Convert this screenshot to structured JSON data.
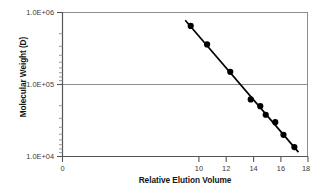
{
  "chart_data": {
    "type": "scatter",
    "title": "",
    "xlabel": "Relative Elution Volume",
    "ylabel": "Molecular Weight (D)",
    "xlim": [
      0,
      18
    ],
    "ylim": [
      10000,
      1000000
    ],
    "yscale": "log",
    "xscale": "linear",
    "grid": true,
    "gridlines_y": [
      "1.0E+05"
    ],
    "legend": false,
    "legend_position": "none",
    "xticks": [
      0,
      10,
      12,
      14,
      16,
      18
    ],
    "xtick_labels": [
      "0",
      "10",
      "12",
      "14",
      "16",
      "18"
    ],
    "yticks": [
      1000000,
      100000,
      10000
    ],
    "ytick_labels": [
      "1.0E+06",
      "1.0E+05",
      "1.0E+04"
    ],
    "series": [
      {
        "name": "Molecular weight standards",
        "marker": "filled-circle",
        "marker_color": "#000000",
        "x": [
          9.4,
          10.6,
          12.3,
          13.8,
          14.5,
          14.9,
          15.6,
          16.2,
          17.0
        ],
        "y": [
          650000,
          360000,
          150000,
          62000,
          50000,
          38000,
          30000,
          20000,
          13500
        ]
      },
      {
        "name": "Linear regression fit",
        "type": "line",
        "line_color": "#000000",
        "x": [
          9.0,
          17.3
        ],
        "y": [
          780000,
          11500
        ]
      }
    ]
  },
  "axes": {
    "y_title": "Molecular Weight (D)",
    "x_title": "Relative Elution Volume",
    "y_labels": [
      "1.0E+06",
      "1.0E+05",
      "1.0E+04"
    ],
    "x_labels": [
      "0",
      "10",
      "12",
      "14",
      "16",
      "18"
    ]
  },
  "colors": {
    "axis": "#6e6e6e",
    "gridline": "#8c8c8c",
    "data_line": "#000000",
    "marker": "#000000",
    "text": "#141414",
    "background": "#ffffff"
  }
}
